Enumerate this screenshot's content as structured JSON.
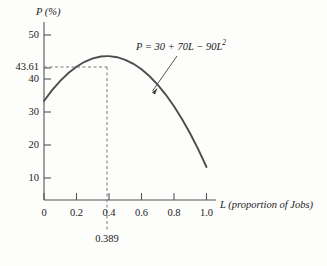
{
  "chart_data": {
    "type": "line",
    "title": "",
    "subtitle": "",
    "xlabel": "L (proportion of Jobs)",
    "ylabel": "P (%)",
    "xlim": [
      0,
      1.05
    ],
    "ylim": [
      0,
      55
    ],
    "grid": false,
    "legend_position": "none",
    "equation_annotation": "P = 30 + 70L − 90L",
    "equation_exponent": "2",
    "x_ticks": [
      "0",
      "0.2",
      "0.4",
      "0.6",
      "0.8",
      "1.0"
    ],
    "x_tick_values": [
      0,
      0.2,
      0.4,
      0.6,
      0.8,
      1.0
    ],
    "y_ticks": [
      "10",
      "20",
      "30",
      "40",
      "50"
    ],
    "y_tick_values": [
      10,
      20,
      30,
      40,
      50
    ],
    "highlight_y_label": "43.61",
    "highlight_y_value": 43.61,
    "highlight_x_label": "0.389",
    "highlight_x_value": 0.389,
    "curve_color": "#4d4d4d",
    "axis_color": "#555555",
    "dash_color": "#7a7a7a",
    "x": [
      0.0,
      0.05,
      0.1,
      0.15,
      0.2,
      0.25,
      0.3,
      0.35,
      0.389,
      0.4,
      0.45,
      0.5,
      0.55,
      0.6,
      0.65,
      0.7,
      0.75,
      0.8,
      0.85,
      0.9,
      0.95,
      1.0
    ],
    "y": [
      30.0,
      33.28,
      36.1,
      38.48,
      40.4,
      41.88,
      42.9,
      43.48,
      43.61,
      43.6,
      43.28,
      42.5,
      41.28,
      39.6,
      37.48,
      34.9,
      31.88,
      28.4,
      24.48,
      20.1,
      15.28,
      10.0
    ],
    "series": [
      {
        "name": "P = 30 + 70L − 90L^2",
        "values": [
          30.0,
          33.28,
          36.1,
          38.48,
          40.4,
          41.88,
          42.9,
          43.48,
          43.61,
          43.6,
          43.28,
          42.5,
          41.28,
          39.6,
          37.48,
          34.9,
          31.88,
          28.4,
          24.48,
          20.1,
          15.28,
          10.0
        ]
      }
    ],
    "annotations": [
      {
        "text": "P = 30 + 70L − 90L2",
        "type": "equation-with-arrow",
        "arrow_points_to": [
          0.64,
          37.9
        ]
      },
      {
        "text": "43.61",
        "type": "dashed-horizontal-from-y-axis"
      },
      {
        "text": "0.389",
        "type": "dashed-vertical-below-x-axis"
      }
    ],
    "vertex": {
      "x": 0.389,
      "y": 43.61
    }
  }
}
